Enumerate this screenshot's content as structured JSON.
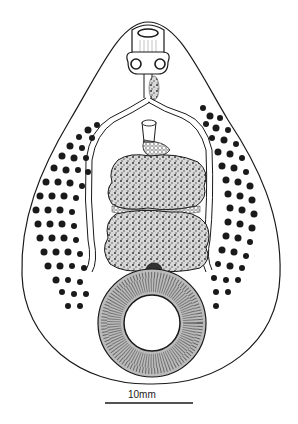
{
  "figure": {
    "scale_bar": {
      "label": "10mm"
    },
    "colors": {
      "ink": "#1a1a1a",
      "paper": "#ffffff",
      "stipple": "#555555"
    }
  }
}
